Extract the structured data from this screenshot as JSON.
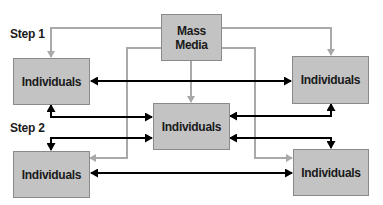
{
  "diagram": {
    "steps": [
      {
        "label": "Step 1"
      },
      {
        "label": "Step 2"
      }
    ],
    "nodes": {
      "mass_media": {
        "line1": "Mass",
        "line2": "Media"
      },
      "individuals_top_left": {
        "label": "Individuals"
      },
      "individuals_top_right": {
        "label": "Individuals"
      },
      "individuals_center": {
        "label": "Individuals"
      },
      "individuals_bottom_left": {
        "label": "Individuals"
      },
      "individuals_bottom_right": {
        "label": "Individuals"
      }
    },
    "colors": {
      "box_fill": "#c3c3c3",
      "box_border": "#8a8a8a",
      "media_link": "#a9a9a9",
      "interpersonal_link": "#000000"
    }
  }
}
